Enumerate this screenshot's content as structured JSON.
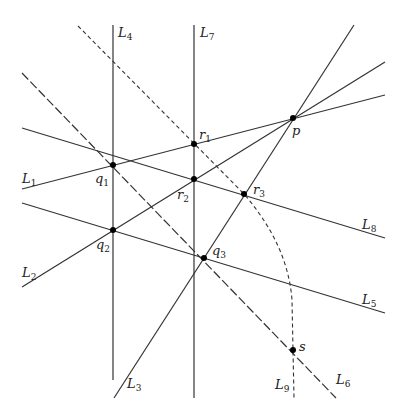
{
  "diagram": {
    "title": "",
    "stroke_color": "#333333",
    "point_color": "#000000",
    "background": "#ffffff",
    "lines": [
      {
        "id": "L1",
        "name": "L",
        "sub": "1",
        "style": "solid",
        "from": [
          22,
          189
        ],
        "to": [
          385,
          95
        ],
        "label_pos": [
          22,
          170
        ]
      },
      {
        "id": "L2",
        "name": "L",
        "sub": "2",
        "style": "solid",
        "from": [
          22,
          287
        ],
        "to": [
          385,
          62
        ],
        "label_pos": [
          22,
          265
        ]
      },
      {
        "id": "L3",
        "name": "L",
        "sub": "3",
        "style": "solid",
        "from": [
          114,
          398
        ],
        "to": [
          354,
          25
        ],
        "label_pos": [
          127,
          376
        ]
      },
      {
        "id": "L4",
        "name": "L",
        "sub": "4",
        "style": "solid",
        "from": [
          113,
          25
        ],
        "to": [
          113,
          380
        ],
        "label_pos": [
          118,
          25
        ]
      },
      {
        "id": "L5",
        "name": "L",
        "sub": "5",
        "style": "solid",
        "from": [
          22,
          203
        ],
        "to": [
          385,
          313
        ],
        "label_pos": [
          362,
          292
        ]
      },
      {
        "id": "L6",
        "name": "L",
        "sub": "6",
        "style": "dashed-long",
        "from": [
          22,
          73
        ],
        "to": [
          336,
          398
        ],
        "label_pos": [
          336,
          373
        ]
      },
      {
        "id": "L7",
        "name": "L",
        "sub": "7",
        "style": "solid",
        "from": [
          194,
          25
        ],
        "to": [
          194,
          398
        ],
        "label_pos": [
          200,
          25
        ]
      },
      {
        "id": "L8",
        "name": "L",
        "sub": "8",
        "style": "solid",
        "from": [
          22,
          128
        ],
        "to": [
          385,
          238
        ],
        "label_pos": [
          362,
          217
        ]
      },
      {
        "id": "L9",
        "name": "L",
        "sub": "9",
        "style": "dashed-short",
        "path": "M 78 26 L 244 194 Q 288 245 292 300 L 293 350 L 294 398",
        "label_pos": [
          275,
          377
        ]
      }
    ],
    "points": [
      {
        "id": "p",
        "name": "p",
        "sub": "",
        "at": [
          293,
          118
        ],
        "label_pos": [
          293,
          124
        ]
      },
      {
        "id": "q1",
        "name": "q",
        "sub": "1",
        "at": [
          113,
          165
        ],
        "label_pos": [
          94,
          172
        ]
      },
      {
        "id": "q2",
        "name": "q",
        "sub": "2",
        "at": [
          113,
          230
        ],
        "label_pos": [
          96,
          238
        ]
      },
      {
        "id": "q3",
        "name": "q",
        "sub": "3",
        "at": [
          204,
          258
        ],
        "label_pos": [
          211,
          242
        ]
      },
      {
        "id": "r1",
        "name": "r",
        "sub": "1",
        "at": [
          194,
          144
        ],
        "label_pos": [
          199,
          127
        ]
      },
      {
        "id": "r2",
        "name": "r",
        "sub": "2",
        "at": [
          194,
          179
        ],
        "label_pos": [
          178,
          187
        ]
      },
      {
        "id": "r3",
        "name": "r",
        "sub": "3",
        "at": [
          244,
          194
        ],
        "label_pos": [
          252,
          182
        ]
      },
      {
        "id": "s",
        "name": "s",
        "sub": "",
        "at": [
          293,
          350
        ],
        "label_pos": [
          299,
          338
        ]
      }
    ]
  },
  "labels": {
    "L1": {
      "base": "L",
      "sub": "1"
    },
    "L2": {
      "base": "L",
      "sub": "2"
    },
    "L3": {
      "base": "L",
      "sub": "3"
    },
    "L4": {
      "base": "L",
      "sub": "4"
    },
    "L5": {
      "base": "L",
      "sub": "5"
    },
    "L6": {
      "base": "L",
      "sub": "6"
    },
    "L7": {
      "base": "L",
      "sub": "7"
    },
    "L8": {
      "base": "L",
      "sub": "8"
    },
    "L9": {
      "base": "L",
      "sub": "9"
    },
    "p": {
      "base": "p",
      "sub": ""
    },
    "q1": {
      "base": "q",
      "sub": "1"
    },
    "q2": {
      "base": "q",
      "sub": "2"
    },
    "q3": {
      "base": "q",
      "sub": "3"
    },
    "r1": {
      "base": "r",
      "sub": "1"
    },
    "r2": {
      "base": "r",
      "sub": "2"
    },
    "r3": {
      "base": "r",
      "sub": "3"
    },
    "s": {
      "base": "s",
      "sub": ""
    }
  }
}
